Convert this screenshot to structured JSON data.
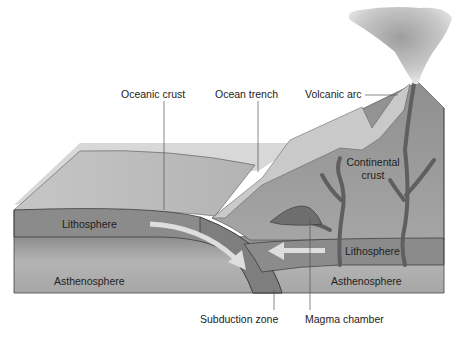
{
  "diagram": {
    "labels": {
      "oceanic_crust": "Oceanic crust",
      "ocean_trench": "Ocean trench",
      "volcanic_arc": "Volcanic arc",
      "continental_crust_line1": "Continental",
      "continental_crust_line2": "crust",
      "lithosphere_left": "Lithosphere",
      "lithosphere_right": "Lithosphere",
      "asthenosphere_left": "Asthenosphere",
      "asthenosphere_right": "Asthenosphere",
      "subduction_zone": "Subduction zone",
      "magma_chamber": "Magma chamber"
    },
    "colors": {
      "background": "#ffffff",
      "ocean_surface": "#b9b9b9",
      "lithosphere": "#8a8a8a",
      "asthenosphere": "#a9a9a9",
      "continental_crust": "#9a9a9a",
      "mountain_slope": "#c4c4c4",
      "magma": "#6f6f6f",
      "arrow": "#e2e2e2",
      "smoke": "#bdbdbd",
      "leader_line": "#555555",
      "outline": "#3a3a3a"
    }
  }
}
